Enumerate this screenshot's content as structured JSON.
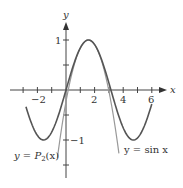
{
  "chart_data": {
    "type": "line",
    "title": "",
    "xlabel": "x",
    "ylabel": "y",
    "xlim": [
      -3.0,
      6.8
    ],
    "ylim": [
      -1.7,
      1.8
    ],
    "grid": false,
    "x_ticks": [
      -2,
      -1,
      0,
      1,
      2,
      3,
      4,
      5,
      6
    ],
    "x_tick_labels": [
      "-2",
      "2",
      "4",
      "6"
    ],
    "y_ticks": [
      -1.5,
      -1,
      -0.5,
      0.5,
      1
    ],
    "y_tick_labels": [
      "1",
      "-1"
    ],
    "series": [
      {
        "name": "y = sin x",
        "function": "sin(x)",
        "x_range": [
          -2.8,
          6.0
        ],
        "color": "#555555"
      },
      {
        "name": "y = P2(x)",
        "function": "1 - (x - pi/2)^2 / 2",
        "x_range": [
          -0.6,
          3.7
        ],
        "color": "#999999"
      }
    ],
    "annotations": [
      {
        "text": "y = P2(x)",
        "x": -2.3,
        "y": -1.2
      },
      {
        "text": "y = sin x",
        "x": 4.1,
        "y": -1.15
      }
    ]
  },
  "labels": {
    "x_axis": "x",
    "y_axis": "y",
    "xt_m2": "−2",
    "xt_2": "2",
    "xt_4": "4",
    "xt_6": "6",
    "yt_1": "1",
    "yt_m1": "−1",
    "p2_prefix": "y = ",
    "p2_P": "P",
    "p2_sub": "2",
    "p2_suffix": "(x)",
    "sin_label": "y = sin x"
  }
}
